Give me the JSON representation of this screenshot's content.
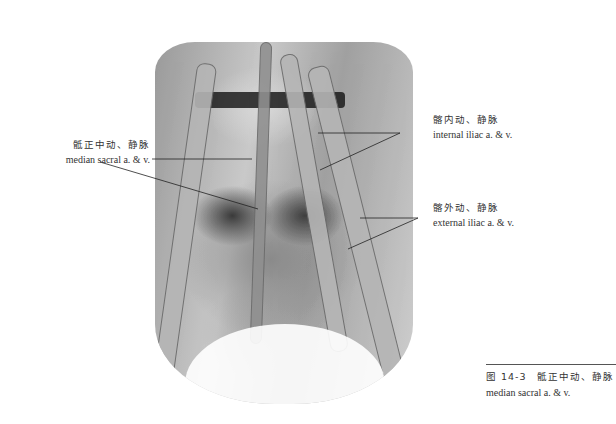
{
  "figure": {
    "number": "图 14-3",
    "caption_zh": "骶正中动、静脉",
    "caption_en": "median sacral a. & v."
  },
  "labels": {
    "median_sacral": {
      "zh": "骶正中动、静脉",
      "en": "median sacral a. & v."
    },
    "internal_iliac": {
      "zh": "髂内动、静脉",
      "en": "internal iliac a. & v."
    },
    "external_iliac": {
      "zh": "髂外动、静脉",
      "en": "external iliac a. & v."
    }
  },
  "colors": {
    "text": "#333333",
    "leader_line": "#222222",
    "rule": "#555555"
  }
}
